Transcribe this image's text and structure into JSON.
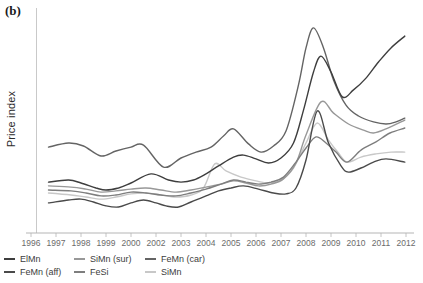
{
  "panel_label": "(b)",
  "chart_data": {
    "type": "line",
    "title": "",
    "xlabel": "",
    "ylabel": "Price index",
    "x_tick_labels": [
      "1996",
      "1997",
      "1998",
      "1999",
      "2000",
      "2002",
      "2003",
      "2004",
      "2005",
      "2006",
      "2007",
      "2008",
      "2009",
      "2010",
      "2011",
      "2012"
    ],
    "y_axis": {
      "min": 0,
      "max": 100,
      "tick_labels_visible": false,
      "grid": false
    },
    "legend_position": "bottom",
    "legend_rows": [
      [
        "ElMn",
        "SiMn (sur)",
        "FeMn (car)"
      ],
      [
        "FeMn (aff)",
        "FeSi",
        "SiMn"
      ]
    ],
    "series": [
      {
        "name": "SiMn",
        "color": "#c8c8c8",
        "x": [
          0.7,
          1.6,
          2.2,
          2.8,
          3.4,
          4.0,
          4.6,
          5.2,
          5.8,
          6.4,
          6.9,
          7.35,
          7.8,
          8.4,
          9.0,
          9.5,
          10.0,
          10.5,
          11.0,
          11.45,
          11.9,
          12.3,
          12.65,
          13.2,
          13.8,
          14.4,
          14.95
        ],
        "values": [
          19.4,
          18.5,
          17.6,
          16.7,
          17.6,
          19.0,
          19.4,
          18.5,
          17.6,
          18.5,
          21.6,
          32.2,
          29.1,
          26.4,
          24.7,
          23.8,
          25.1,
          30.4,
          41.4,
          50.2,
          42.7,
          37.0,
          33.0,
          35.2,
          36.6,
          37.4,
          37.4
        ]
      },
      {
        "name": "SiMn (sur)",
        "color": "#989898",
        "x": [
          0.7,
          1.6,
          2.2,
          2.8,
          3.4,
          4.0,
          4.6,
          5.2,
          5.8,
          6.4,
          7.0,
          7.6,
          8.1,
          8.6,
          9.1,
          9.6,
          10.1,
          10.6,
          11.0,
          11.6,
          12.1,
          12.7,
          13.3,
          13.7,
          14.2,
          14.95
        ],
        "values": [
          22.5,
          22.0,
          21.1,
          19.8,
          20.3,
          21.1,
          21.6,
          20.7,
          19.8,
          20.7,
          22.0,
          23.3,
          24.7,
          23.8,
          22.5,
          23.3,
          25.6,
          32.6,
          44.9,
          59.5,
          54.6,
          49.8,
          47.1,
          45.8,
          47.6,
          51.5
        ]
      },
      {
        "name": "FeSi",
        "color": "#7e7e7e",
        "x": [
          0.7,
          1.6,
          2.2,
          2.8,
          3.4,
          4.0,
          4.6,
          5.2,
          5.8,
          6.4,
          7.0,
          7.6,
          8.1,
          8.6,
          9.1,
          9.6,
          10.1,
          10.6,
          11.0,
          11.4,
          11.8,
          12.2,
          12.64,
          13.2,
          13.8,
          14.36,
          14.95
        ],
        "values": [
          20.7,
          20.3,
          19.4,
          18.1,
          18.5,
          19.8,
          19.4,
          18.5,
          18.1,
          19.4,
          21.1,
          23.3,
          25.1,
          24.2,
          23.3,
          24.2,
          26.4,
          33.0,
          39.2,
          44.1,
          41.4,
          37.4,
          33.0,
          38.3,
          41.9,
          45.8,
          48.0
        ]
      },
      {
        "name": "FeMn (car)",
        "color": "#646464",
        "x": [
          0.7,
          1.5,
          2.1,
          2.8,
          3.4,
          4.0,
          4.5,
          5.3,
          6.0,
          6.6,
          7.2,
          7.7,
          8.1,
          8.7,
          9.2,
          9.7,
          10.2,
          10.7,
          11.0,
          11.3,
          11.7,
          12.1,
          12.6,
          13.1,
          13.7,
          14.2,
          14.6,
          14.95
        ],
        "values": [
          39.6,
          41.4,
          40.1,
          35.7,
          37.9,
          39.6,
          40.5,
          30.8,
          34.8,
          37.4,
          39.6,
          44.5,
          47.6,
          41.0,
          37.4,
          40.1,
          46.7,
          67.0,
          83.3,
          92.1,
          83.3,
          69.2,
          58.1,
          53.3,
          50.7,
          49.8,
          50.7,
          52.4
        ]
      },
      {
        "name": "FeMn (aff)",
        "color": "#4a4a4a",
        "x": [
          0.7,
          1.5,
          2.0,
          2.5,
          3.0,
          3.5,
          4.0,
          4.5,
          5.0,
          5.4,
          5.9,
          6.4,
          7.0,
          7.5,
          8.0,
          8.5,
          9.1,
          9.7,
          10.2,
          10.6,
          11.0,
          11.45,
          11.9,
          12.4,
          12.7,
          13.2,
          13.7,
          14.2,
          14.95
        ],
        "values": [
          15.0,
          16.3,
          16.7,
          15.4,
          13.7,
          13.2,
          15.0,
          16.3,
          15.0,
          13.7,
          13.2,
          15.4,
          18.1,
          20.3,
          21.6,
          22.5,
          21.1,
          19.4,
          19.0,
          21.6,
          33.9,
          55.5,
          41.4,
          31.3,
          28.6,
          30.4,
          33.0,
          34.4,
          33.0
        ]
      },
      {
        "name": "ElMn",
        "color": "#3e3e3e",
        "x": [
          0.7,
          1.5,
          2.0,
          2.6,
          3.0,
          3.5,
          4.0,
          4.8,
          5.5,
          6.0,
          6.5,
          7.0,
          7.5,
          8.1,
          8.5,
          9.0,
          9.5,
          10.0,
          10.5,
          10.9,
          11.3,
          11.6,
          12.0,
          12.45,
          12.9,
          13.4,
          13.9,
          14.4,
          14.95
        ],
        "values": [
          24.2,
          25.1,
          23.8,
          21.6,
          20.7,
          21.6,
          23.8,
          27.8,
          25.1,
          24.2,
          25.1,
          27.8,
          31.3,
          35.2,
          36.1,
          34.4,
          32.6,
          34.8,
          41.4,
          55.9,
          72.7,
          79.7,
          72.7,
          61.7,
          64.8,
          70.0,
          77.1,
          83.3,
          88.5
        ]
      }
    ],
    "axis_colors": {
      "y_axis_line": "#c9c9c9",
      "x_axis_line": "#b5b5b5",
      "tick_label_color": "#6b6b6b"
    }
  }
}
